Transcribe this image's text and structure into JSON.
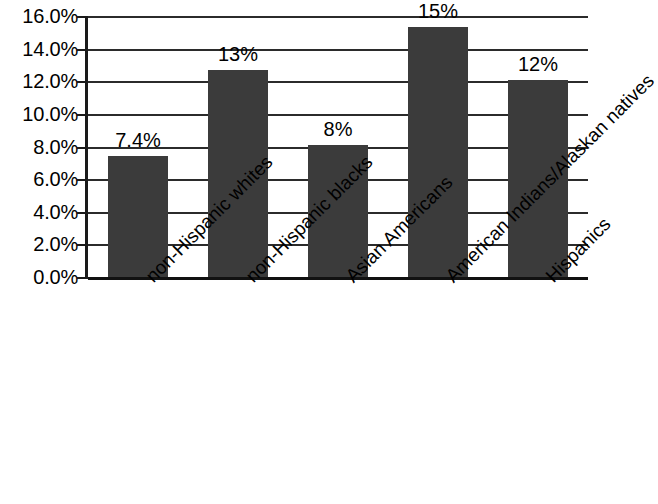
{
  "chart_data": {
    "type": "bar",
    "title": "",
    "subtitle": "",
    "xlabel": "",
    "ylabel": "",
    "categories": [
      "non-Hispanic whites",
      "non-Hispanic blacks",
      "Asian Americans",
      "American Indians/Alaskan natives",
      "Hispanics"
    ],
    "values": [
      7.4,
      12.7,
      8.1,
      15.3,
      12.1
    ],
    "data_labels": [
      "7.4%",
      "13%",
      "8%",
      "15%",
      "12%"
    ],
    "ylim": [
      0,
      16
    ],
    "ytick_values": [
      0,
      2,
      4,
      6,
      8,
      10,
      12,
      14,
      16
    ],
    "ytick_labels": [
      "0.0%",
      "2.0%",
      "4.0%",
      "6.0%",
      "8.0%",
      "10.0%",
      "12.0%",
      "14.0%",
      "16.0%"
    ],
    "grid": true,
    "grid_orientation": "horizontal",
    "legend": false,
    "legend_position": "none",
    "bar_color": "#3b3b3b",
    "axis_color": "#1a1a1a",
    "background_color": "#ffffff",
    "xtick_label_rotation": -45
  }
}
